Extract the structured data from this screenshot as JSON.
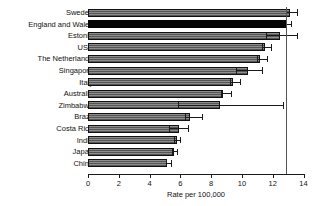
{
  "chart_data": {
    "type": "bar",
    "orientation": "horizontal",
    "title": "",
    "subtitle": "",
    "xlabel": "Rate per 100,000",
    "ylabel": "",
    "xlim": [
      0,
      14
    ],
    "xticks": [
      0,
      2,
      4,
      6,
      8,
      10,
      12,
      14
    ],
    "xtick_labels": [
      "0",
      "2",
      "4",
      "6",
      "8",
      "10",
      "12",
      "14"
    ],
    "grid": false,
    "legend": "none",
    "reference_line": {
      "value": 12.85,
      "label": "England and Wales rate"
    },
    "categories": [
      "Sweden",
      "England and Wales",
      "Estonia",
      "USA",
      "The Netherlands",
      "Singapore",
      "Italy",
      "Australia",
      "Zimbabwe",
      "Brazil",
      "Costa Rica",
      "India",
      "Japan",
      "China"
    ],
    "values": [
      13.1,
      12.85,
      12.5,
      11.5,
      11.2,
      10.4,
      9.4,
      8.8,
      8.6,
      6.65,
      5.9,
      5.75,
      5.6,
      5.15
    ],
    "errors_low": [
      12.85,
      12.85,
      11.55,
      11.3,
      10.95,
      9.6,
      9.25,
      8.65,
      5.85,
      6.3,
      5.25,
      5.6,
      5.45,
      5.05
    ],
    "errors_high": [
      13.55,
      13.2,
      13.55,
      11.9,
      11.6,
      11.3,
      9.9,
      9.3,
      12.7,
      7.4,
      6.5,
      6.0,
      5.8,
      5.4
    ],
    "bar_styles": [
      "hatch",
      "solid",
      "hatch",
      "hatch",
      "hatch",
      "hatch",
      "hatch",
      "hatch",
      "hatch",
      "hatch",
      "hatch",
      "hatch",
      "hatch",
      "hatch"
    ]
  },
  "colors": {
    "bar_fill": "#8d8d8d",
    "bar_highlight": "#050505",
    "axis": "#1a1a1a",
    "reference_line": "#555555",
    "background": "#ffffff"
  }
}
